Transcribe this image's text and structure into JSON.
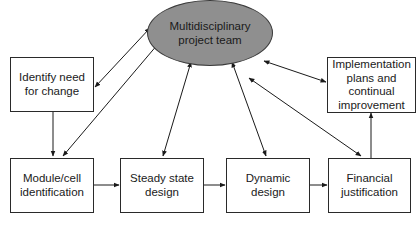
{
  "center": {
    "label": "Multidisciplinary\nproject team",
    "fill": "#8f8f8f"
  },
  "nodes": [
    {
      "id": "identify",
      "label": "Identify need\nfor change"
    },
    {
      "id": "implementation",
      "label": "Implementation\nplans and\ncontinual\nimprovement"
    },
    {
      "id": "module",
      "label": "Module/cell\nidentification"
    },
    {
      "id": "steady",
      "label": "Steady state\ndesign"
    },
    {
      "id": "dynamic",
      "label": "Dynamic\ndesign"
    },
    {
      "id": "financial",
      "label": "Financial\njustification"
    }
  ],
  "edges": [
    {
      "from": "center",
      "to": "identify",
      "type": "bidirectional"
    },
    {
      "from": "center",
      "to": "module",
      "type": "bidirectional"
    },
    {
      "from": "center",
      "to": "steady",
      "type": "bidirectional"
    },
    {
      "from": "center",
      "to": "dynamic",
      "type": "bidirectional"
    },
    {
      "from": "center",
      "to": "financial",
      "type": "bidirectional"
    },
    {
      "from": "center",
      "to": "implementation",
      "type": "bidirectional"
    },
    {
      "from": "identify",
      "to": "module",
      "type": "directed"
    },
    {
      "from": "module",
      "to": "steady",
      "type": "directed"
    },
    {
      "from": "steady",
      "to": "dynamic",
      "type": "directed"
    },
    {
      "from": "dynamic",
      "to": "financial",
      "type": "directed"
    },
    {
      "from": "financial",
      "to": "implementation",
      "type": "directed"
    }
  ]
}
